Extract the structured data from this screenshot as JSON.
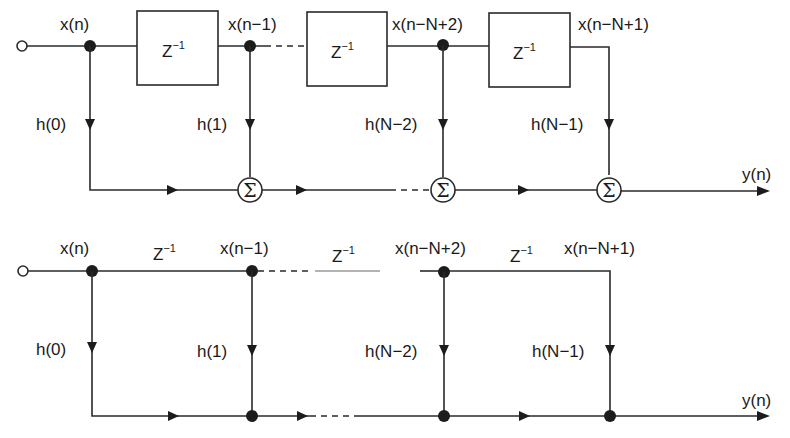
{
  "figure": {
    "top_structure": {
      "type": "block-diagram",
      "input_label": "x(n)",
      "delay_label": "Z",
      "delay_exp": "−1",
      "tap_labels": [
        "x(n)",
        "x(n−1)",
        "x(n−N+2)",
        "x(n−N+1)"
      ],
      "coefficients": [
        "h(0)",
        "h(1)",
        "h(N−2)",
        "h(N−1)"
      ],
      "sum_symbol": "Σ",
      "output_label": "y(n)"
    },
    "bottom_structure": {
      "type": "signal-flow-graph",
      "input_label": "x(n)",
      "delay_label": "Z",
      "delay_exp": "−1",
      "tap_labels": [
        "x(n)",
        "x(n−1)",
        "x(n−N+2)",
        "x(n−N+1)"
      ],
      "coefficients": [
        "h(0)",
        "h(1)",
        "h(N−2)",
        "h(N−1)"
      ],
      "output_label": "y(n)"
    }
  }
}
